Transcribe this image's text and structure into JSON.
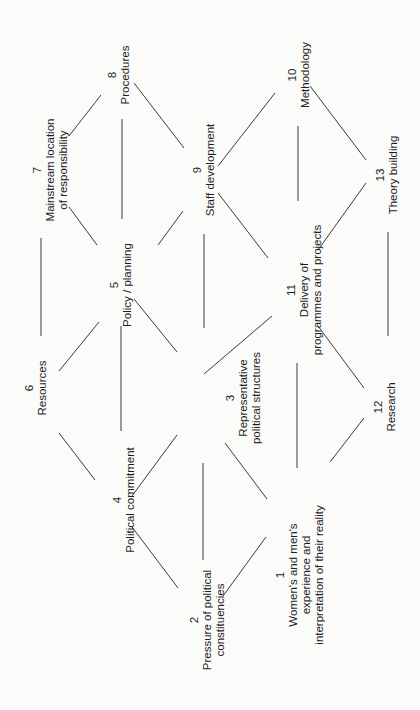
{
  "diagram": {
    "orientation": "rotated 90 degrees counter-clockwise",
    "colors": {
      "background": "#fbfbfa",
      "line": "#3a3a3a",
      "text": "#1e1e1e"
    },
    "nodes": [
      {
        "id": 1,
        "number": "1",
        "lines": [
          "Women's and men's",
          "experience and",
          "interpretation of their reality"
        ],
        "x": 300,
        "y": 575
      },
      {
        "id": 2,
        "number": "2",
        "lines": [
          "Pressure of political",
          "constituencies"
        ],
        "x": 207,
        "y": 620
      },
      {
        "id": 3,
        "number": "3",
        "lines": [
          "Representative",
          "political structures"
        ],
        "x": 243,
        "y": 398
      },
      {
        "id": 4,
        "number": "4",
        "lines": [
          "Political commitment"
        ],
        "x": 124,
        "y": 500
      },
      {
        "id": 5,
        "number": "5",
        "lines": [
          "Policy / planning"
        ],
        "x": 121,
        "y": 285
      },
      {
        "id": 6,
        "number": "6",
        "lines": [
          "Resources"
        ],
        "x": 36,
        "y": 388
      },
      {
        "id": 7,
        "number": "7",
        "lines": [
          "Mainstream location",
          "of responsibility"
        ],
        "x": 50,
        "y": 170
      },
      {
        "id": 8,
        "number": "8",
        "lines": [
          "Procedures"
        ],
        "x": 119,
        "y": 75
      },
      {
        "id": 9,
        "number": "9",
        "lines": [
          "Staff development"
        ],
        "x": 204,
        "y": 170
      },
      {
        "id": 10,
        "number": "10",
        "lines": [
          "Methodology"
        ],
        "x": 299,
        "y": 75
      },
      {
        "id": 11,
        "number": "11",
        "lines": [
          "Delivery of",
          "programmes and projects"
        ],
        "x": 304,
        "y": 290
      },
      {
        "id": 12,
        "number": "12",
        "lines": [
          "Research"
        ],
        "x": 385,
        "y": 407
      },
      {
        "id": 13,
        "number": "13",
        "lines": [
          "Theory building"
        ],
        "x": 387,
        "y": 175
      }
    ],
    "edges": [
      {
        "from": 7,
        "to": 8,
        "x1": 69,
        "y1": 136,
        "x2": 101,
        "y2": 95
      },
      {
        "from": 8,
        "to": 9,
        "x1": 134,
        "y1": 83,
        "x2": 184,
        "y2": 148
      },
      {
        "from": 8,
        "to": 5,
        "x1": 122,
        "y1": 119,
        "x2": 122,
        "y2": 219
      },
      {
        "from": 7,
        "to": 5,
        "x1": 69,
        "y1": 207,
        "x2": 97,
        "y2": 245
      },
      {
        "from": 9,
        "to": 5,
        "x1": 183,
        "y1": 211,
        "x2": 158,
        "y2": 245
      },
      {
        "from": 9,
        "to": 10,
        "x1": 218,
        "y1": 166,
        "x2": 275,
        "y2": 93
      },
      {
        "from": 9,
        "to": 11,
        "x1": 218,
        "y1": 193,
        "x2": 268,
        "y2": 258
      },
      {
        "from": 10,
        "to": 11,
        "x1": 298,
        "y1": 126,
        "x2": 298,
        "y2": 201
      },
      {
        "from": 10,
        "to": 13,
        "x1": 310,
        "y1": 86,
        "x2": 366,
        "y2": 160
      },
      {
        "from": 13,
        "to": 11,
        "x1": 366,
        "y1": 183,
        "x2": 318,
        "y2": 250
      },
      {
        "from": 13,
        "to": 12,
        "x1": 388,
        "y1": 232,
        "x2": 388,
        "y2": 336
      },
      {
        "from": 6,
        "to": 7,
        "x1": 41,
        "y1": 238,
        "x2": 41,
        "y2": 336
      },
      {
        "from": 6,
        "to": 5,
        "x1": 59,
        "y1": 371,
        "x2": 99,
        "y2": 322
      },
      {
        "from": 5,
        "to": 3,
        "x1": 134,
        "y1": 299,
        "x2": 177,
        "y2": 352
      },
      {
        "from": 5,
        "to": 4,
        "x1": 121,
        "y1": 326,
        "x2": 121,
        "y2": 431
      },
      {
        "from": 6,
        "to": 4,
        "x1": 59,
        "y1": 433,
        "x2": 95,
        "y2": 480
      },
      {
        "from": 3,
        "to": 9,
        "x1": 204,
        "y1": 234,
        "x2": 204,
        "y2": 328
      },
      {
        "from": 3,
        "to": 11,
        "x1": 204,
        "y1": 374,
        "x2": 272,
        "y2": 316
      },
      {
        "from": 3,
        "to": 4,
        "x1": 177,
        "y1": 435,
        "x2": 132,
        "y2": 496
      },
      {
        "from": 4,
        "to": 2,
        "x1": 132,
        "y1": 527,
        "x2": 178,
        "y2": 588
      },
      {
        "from": 3,
        "to": 2,
        "x1": 203,
        "y1": 463,
        "x2": 203,
        "y2": 560
      },
      {
        "from": 3,
        "to": 1,
        "x1": 225,
        "y1": 443,
        "x2": 267,
        "y2": 499
      },
      {
        "from": 2,
        "to": 1,
        "x1": 223,
        "y1": 596,
        "x2": 266,
        "y2": 537
      },
      {
        "from": 11,
        "to": 1,
        "x1": 297,
        "y1": 363,
        "x2": 297,
        "y2": 468
      },
      {
        "from": 11,
        "to": 12,
        "x1": 318,
        "y1": 326,
        "x2": 364,
        "y2": 388
      },
      {
        "from": 12,
        "to": 1,
        "x1": 364,
        "y1": 418,
        "x2": 330,
        "y2": 462
      }
    ]
  }
}
